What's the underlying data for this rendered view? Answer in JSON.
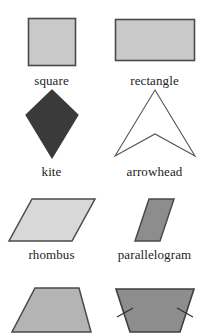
{
  "figure": {
    "background_color": "#ffffff",
    "columns": 2,
    "rows": 4
  },
  "palette": {
    "light_gray_fill": "#c9c9c9",
    "pale_gray_fill": "#d8d8d8",
    "medium_gray_fill": "#8d8d8d",
    "dark_fill": "#3a3a3a",
    "white_fill": "#ffffff",
    "outline": "#4a4a4a",
    "thin_outline": "#555555",
    "text_color": "#1c1c1c"
  },
  "shapes": [
    {
      "id": "square",
      "label": "square",
      "icon": "square-shape-icon",
      "fill": "#c9c9c9",
      "stroke": "#4a4a4a",
      "row": 1,
      "column": "left",
      "sides": 4,
      "label_visible": true
    },
    {
      "id": "rectangle",
      "label": "rectangle",
      "icon": "rectangle-shape-icon",
      "fill": "#c9c9c9",
      "stroke": "#4a4a4a",
      "row": 1,
      "column": "right",
      "sides": 4,
      "label_visible": true
    },
    {
      "id": "kite",
      "label": "kite",
      "icon": "kite-shape-icon",
      "fill": "#3a3a3a",
      "stroke": "#3a3a3a",
      "row": 2,
      "column": "left",
      "sides": 4,
      "label_visible": true
    },
    {
      "id": "arrowhead",
      "label": "arrowhead",
      "icon": "arrowhead-shape-icon",
      "fill": "#ffffff",
      "stroke": "#555555",
      "row": 2,
      "column": "right",
      "sides": 4,
      "label_visible": true
    },
    {
      "id": "rhombus",
      "label": "rhombus",
      "icon": "rhombus-shape-icon",
      "fill": "#d8d8d8",
      "stroke": "#4a4a4a",
      "row": 3,
      "column": "left",
      "sides": 4,
      "label_visible": true
    },
    {
      "id": "parallelogram",
      "label": "parallelogram",
      "icon": "parallelogram-shape-icon",
      "fill": "#8d8d8d",
      "stroke": "#4a4a4a",
      "row": 3,
      "column": "right",
      "sides": 4,
      "label_visible": true
    },
    {
      "id": "trapezoid",
      "label": "",
      "icon": "trapezoid-shape-icon",
      "fill": "#b4b4b4",
      "stroke": "#4a4a4a",
      "row": 4,
      "column": "left",
      "sides": 4,
      "label_visible": false,
      "note": "shape cropped at bottom edge of image; caption not visible"
    },
    {
      "id": "isosceles-trapezoid",
      "label": "",
      "icon": "isosceles-trapezoid-shape-icon",
      "fill": "#8d8d8d",
      "stroke": "#3f3f3f",
      "row": 4,
      "column": "right",
      "sides": 4,
      "tick_marks": 2,
      "label_visible": false,
      "note": "tick marks on both slanted legs indicate congruent sides; caption not visible"
    }
  ]
}
